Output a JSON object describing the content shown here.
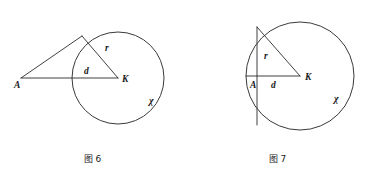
{
  "document": {
    "background_color": "#ffffff",
    "stroke_color": "#2b2b2b",
    "text_color": "#1a1a1a",
    "width": 370,
    "height": 179
  },
  "figures": [
    {
      "id": "figure-6",
      "caption": "图 6",
      "description": "Circle with external point A and tangent line",
      "circle": {
        "center_label": "K",
        "center_x": 118,
        "center_y": 78,
        "radius": 46,
        "name_label": "χ",
        "name_x": 152,
        "name_y": 104
      },
      "points": [
        {
          "label": "A",
          "x": 21,
          "y": 78,
          "label_x": 14,
          "label_y": 88,
          "position": "outside"
        },
        {
          "label": "K",
          "x": 118,
          "y": 78,
          "label_x": 122,
          "label_y": 82,
          "position": "center"
        }
      ],
      "segments": [
        {
          "label": "d",
          "from": "A",
          "to": "K",
          "label_x": 84,
          "label_y": 74
        },
        {
          "label": "r",
          "from": "K",
          "to": "T",
          "label_x": 105,
          "label_y": 51
        }
      ],
      "tangent_point": {
        "x": 82,
        "y": 36
      }
    },
    {
      "id": "figure-7",
      "caption": "图 7",
      "description": "Circle with interior point A and perpendicular chord",
      "circle": {
        "center_label": "K",
        "center_x": 300,
        "center_y": 76,
        "radius": 54,
        "name_label": "χ",
        "name_x": 337,
        "name_y": 102
      },
      "points": [
        {
          "label": "A",
          "x": 257,
          "y": 76,
          "label_x": 251,
          "label_y": 87,
          "position": "inside"
        },
        {
          "label": "K",
          "x": 300,
          "y": 76,
          "label_x": 305,
          "label_y": 80,
          "position": "center"
        }
      ],
      "segments": [
        {
          "label": "d",
          "from": "A",
          "to": "K",
          "label_x": 274,
          "label_y": 87
        },
        {
          "label": "r",
          "from": "K",
          "to": "B",
          "label_x": 266,
          "label_y": 58
        }
      ],
      "chord_top": {
        "x": 257,
        "y": 28
      },
      "chord_bottom": {
        "x": 257,
        "y": 125
      }
    }
  ]
}
